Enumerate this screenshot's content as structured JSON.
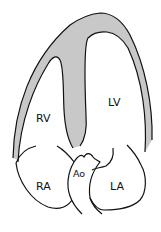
{
  "diagram": {
    "colors": {
      "myocardium_fill": "#c8c8c8",
      "outline": "#111111",
      "background": "#ffffff"
    },
    "labels": {
      "rv": "RV",
      "lv": "LV",
      "ra": "RA",
      "la": "LA",
      "ao": "Ao"
    }
  }
}
